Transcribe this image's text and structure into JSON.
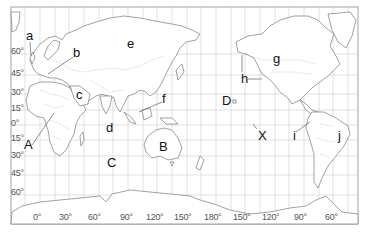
{
  "map": {
    "projection": "world map centered on Pacific (Miller-like)",
    "latitude_labels": [
      {
        "text": "60°",
        "y": 52
      },
      {
        "text": "45°",
        "y": 74
      },
      {
        "text": "30°",
        "y": 93
      },
      {
        "text": "15°",
        "y": 109
      },
      {
        "text": "0°",
        "y": 124
      },
      {
        "text": "15°",
        "y": 139
      },
      {
        "text": "30°",
        "y": 156
      },
      {
        "text": "45°",
        "y": 174
      },
      {
        "text": "60°",
        "y": 193
      }
    ],
    "longitude_labels": [
      {
        "text": "0°",
        "x": 37
      },
      {
        "text": "30°",
        "x": 66
      },
      {
        "text": "60°",
        "x": 94
      },
      {
        "text": "90°",
        "x": 127
      },
      {
        "text": "120°",
        "x": 154
      },
      {
        "text": "150°",
        "x": 182
      },
      {
        "text": "180°",
        "x": 212
      },
      {
        "text": "150°",
        "x": 240
      },
      {
        "text": "120°",
        "x": 270
      },
      {
        "text": "90°",
        "x": 300
      },
      {
        "text": "60°",
        "x": 331
      }
    ],
    "markers": [
      {
        "id": "a",
        "text": "a",
        "x": 27,
        "y": 34
      },
      {
        "id": "b",
        "text": "b",
        "x": 73,
        "y": 51
      },
      {
        "id": "c",
        "text": "c",
        "x": 76,
        "y": 93
      },
      {
        "id": "e",
        "text": "e",
        "x": 127,
        "y": 42
      },
      {
        "id": "f",
        "text": "f",
        "x": 163,
        "y": 97
      },
      {
        "id": "d",
        "text": "d",
        "x": 106,
        "y": 126
      },
      {
        "id": "A",
        "text": "A",
        "x": 24,
        "y": 143
      },
      {
        "id": "B",
        "text": "B",
        "x": 160,
        "y": 144
      },
      {
        "id": "C",
        "text": "C",
        "x": 107,
        "y": 160
      },
      {
        "id": "D",
        "text": "D",
        "x": 222,
        "y": 97
      },
      {
        "id": "g",
        "text": "g",
        "x": 273,
        "y": 56
      },
      {
        "id": "h",
        "text": "h",
        "x": 241,
        "y": 73
      },
      {
        "id": "X",
        "text": "X",
        "x": 258,
        "y": 134
      },
      {
        "id": "i",
        "text": "i",
        "x": 293,
        "y": 133
      },
      {
        "id": "j",
        "text": "j",
        "x": 339,
        "y": 133
      }
    ],
    "colors": {
      "grid": "#c8c8c8",
      "frame": "#8c8c8c",
      "coast": "#7a7a7a",
      "border": "#9a9a9a",
      "label": "#111111"
    }
  }
}
